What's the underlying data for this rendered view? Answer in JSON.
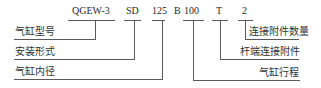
{
  "diagram": {
    "codes": {
      "model": "QGEW-3",
      "mount": "SD",
      "bore": "125",
      "sep": "B",
      "stroke": "100",
      "rod_end": "T",
      "count": "2"
    },
    "labels": {
      "cylinder_model": "气缸型号",
      "mounting_type": "安装形式",
      "cylinder_bore": "气缸内径",
      "attachment_count": "连接附件数量",
      "rod_end_attachment": "杆端连接附件",
      "cylinder_stroke": "气缸行程"
    },
    "colors": {
      "line": "#5a5a5a",
      "text": "#333333"
    }
  }
}
